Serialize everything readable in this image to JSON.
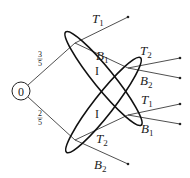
{
  "diagram": {
    "type": "game-tree-with-information-sets",
    "colors": {
      "stroke": "#222222",
      "background": "#ffffff"
    },
    "root": {
      "label": "0",
      "cx": 21,
      "cy": 91,
      "r": 9
    },
    "probabilities": [
      {
        "numerator": "3",
        "denominator": "5",
        "x": 40,
        "y": 58
      },
      {
        "numerator": "2",
        "denominator": "5",
        "x": 40,
        "y": 118
      }
    ],
    "nodes": {
      "upper": {
        "x": 75,
        "y": 43
      },
      "lower": {
        "x": 75,
        "y": 140
      },
      "mid_upper": {
        "x": 128,
        "y": 68
      },
      "mid_lower": {
        "x": 128,
        "y": 115
      }
    },
    "edges": [
      {
        "from": "root",
        "to": "upper"
      },
      {
        "from": "root",
        "to": "lower"
      }
    ],
    "actions": [
      {
        "from": "upper",
        "end": [
          128,
          17
        ],
        "base": "T",
        "sub": "1",
        "lx": 92,
        "ly": 23
      },
      {
        "from": "upper",
        "end": [
          128,
          68
        ],
        "base": "B",
        "sub": "1",
        "lx": 96,
        "ly": 60
      },
      {
        "from": "mid_upper",
        "end": [
          180,
          58
        ],
        "base": "T",
        "sub": "2",
        "lx": 140,
        "ly": 55
      },
      {
        "from": "mid_upper",
        "end": [
          180,
          78
        ],
        "base": "B",
        "sub": "2",
        "lx": 140,
        "ly": 85
      },
      {
        "from": "mid_lower",
        "end": [
          180,
          104
        ],
        "base": "T",
        "sub": "1",
        "lx": 141,
        "ly": 104
      },
      {
        "from": "mid_lower",
        "end": [
          180,
          124
        ],
        "base": "B",
        "sub": "1",
        "lx": 141,
        "ly": 133
      },
      {
        "from": "lower",
        "end": [
          128,
          115
        ],
        "base": "T",
        "sub": "2",
        "lx": 96,
        "ly": 143
      },
      {
        "from": "lower",
        "end": [
          128,
          164
        ],
        "base": "B",
        "sub": "2",
        "lx": 94,
        "ly": 169
      }
    ],
    "information_sets": [
      {
        "label": "I",
        "cx": 103.5,
        "cy": 78.5,
        "rx": 60,
        "ry": 10,
        "angle": 51,
        "lx": 97,
        "ly": 75
      },
      {
        "label": "I",
        "cx": 103.5,
        "cy": 105,
        "rx": 60,
        "ry": 10,
        "angle": -52,
        "lx": 97,
        "ly": 118
      }
    ]
  }
}
